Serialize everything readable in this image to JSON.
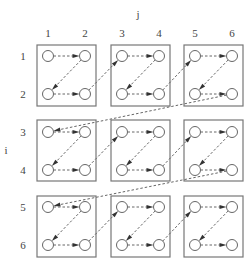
{
  "axes": {
    "column_axis_label": "j",
    "row_axis_label": "i",
    "column_labels": [
      "1",
      "2",
      "3",
      "4",
      "5",
      "6"
    ],
    "row_labels": [
      "1",
      "2",
      "3",
      "4",
      "5",
      "6"
    ]
  },
  "layout": {
    "block_rows": 3,
    "block_cols": 3,
    "block_size": "2x2",
    "col_x": [
      48,
      85,
      122,
      159,
      195,
      232
    ],
    "row_y": [
      56,
      94,
      132,
      170,
      207,
      245
    ],
    "box_x": [
      [
        37,
        96
      ],
      [
        111,
        170
      ],
      [
        184,
        243
      ]
    ],
    "box_y": [
      [
        45,
        106
      ],
      [
        120,
        181
      ],
      [
        196,
        257
      ]
    ],
    "node_radius": 5.5
  },
  "colors": {
    "box_stroke": "#777777",
    "node_stroke": "#666666",
    "edge": "#666666",
    "arrowhead": "#333333",
    "label": "#444444"
  },
  "traversal": "Z-order within each 2x2 block: (1,1)->(1,2)->(2,1)->(2,2), blocks visited row-major"
}
